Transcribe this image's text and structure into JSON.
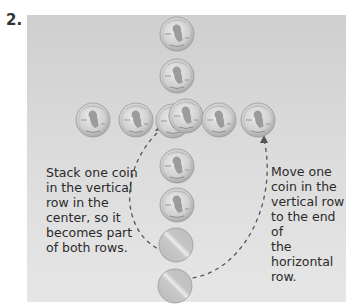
{
  "step_number": "2.",
  "instructions": {
    "left": "Stack one coin in the vertical row in the center, so it becomes part of both rows.",
    "left_lines": [
      "Stack one coin",
      "in the vertical",
      "row in the",
      "center, so it",
      "becomes part",
      "of both rows."
    ],
    "right": "Move one coin in the vertical row to the end of the horizontal row.",
    "right_lines": [
      "Move one",
      "coin in the",
      "vertical row",
      "to the end of",
      "the horizontal",
      "row."
    ]
  },
  "coins": {
    "type": "penny",
    "label": "ONE CENT",
    "vertical_row_heads": 6,
    "vertical_row_tails": 2,
    "horizontal_row": 6
  },
  "colors": {
    "panel": "#d6d6d6",
    "coin_face": "#c9c9c9",
    "arrow": "#555555",
    "text": "#2a2a2a"
  }
}
